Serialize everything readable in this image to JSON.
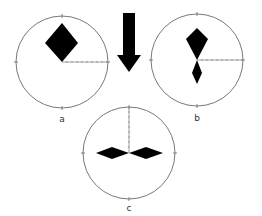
{
  "diagram": {
    "labels": {
      "a": "a",
      "b": "b",
      "c": "c"
    },
    "colors": {
      "circle": "#555555",
      "shape": "#000000",
      "tick": "#666666",
      "label": "#333333"
    },
    "arrow": {
      "direction": "down"
    },
    "panels": [
      {
        "id": "a",
        "shape": "single-diamond-up",
        "scale_axis": "right"
      },
      {
        "id": "b",
        "shape": "double-kite-vertical",
        "scale_axis": "right"
      },
      {
        "id": "c",
        "shape": "double-diamond-horizontal",
        "scale_axis": "up"
      }
    ]
  }
}
